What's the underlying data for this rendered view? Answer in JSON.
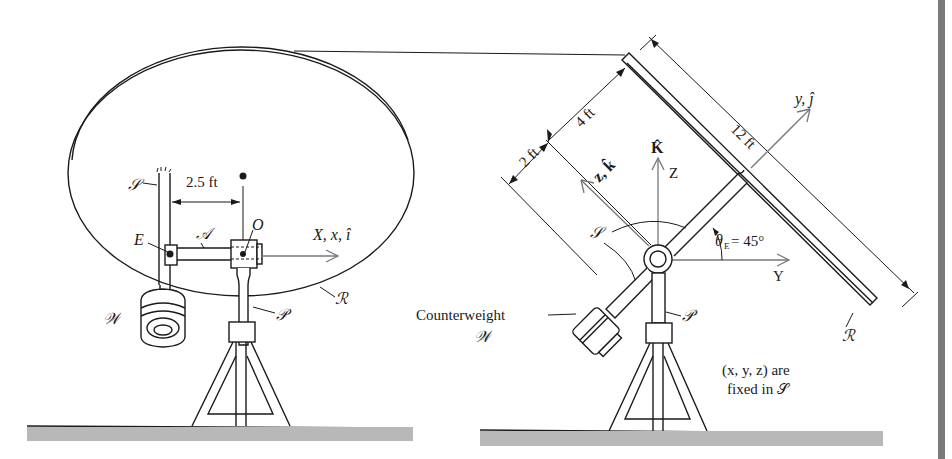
{
  "figure": {
    "left_view": {
      "labels": {
        "support": "𝒮",
        "dimension": "2.5 ft",
        "arm": "𝒜",
        "origin": "O",
        "point_e": "E",
        "axis": "X, x, î",
        "reflector": "ℛ",
        "weight": "𝒲",
        "pedestal": "𝒫"
      }
    },
    "right_view": {
      "labels": {
        "dim_2ft": "2 ft",
        "dim_4ft": "4 ft",
        "dim_12ft": "12 ft",
        "axis_y": "y, ĵ",
        "axis_z": "z, k̂",
        "axis_K": "K̂",
        "axis_Z": "Z",
        "axis_Y": "Y",
        "angle": "θ",
        "angle_sub": "E",
        "angle_value": "= 45°",
        "support": "𝒮",
        "counterweight": "Counterweight",
        "weight": "𝒲",
        "pedestal": "𝒫",
        "reflector": "ℛ",
        "note_line1": "(x, y, z) are",
        "note_line2": "fixed in 𝒮"
      }
    },
    "colors": {
      "ink": "#1a1a1a",
      "axis_gray": "#777777",
      "ground": "#b8b8b8",
      "sidebar": "#7a7a7a"
    }
  }
}
